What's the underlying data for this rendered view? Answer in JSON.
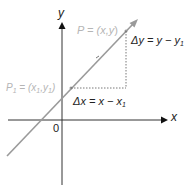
{
  "diagram": {
    "axes": {
      "x_label": "x",
      "y_label": "y",
      "origin_label": "0",
      "color": "#333333"
    },
    "line": {
      "color": "#9a9a9a"
    },
    "points": {
      "P": {
        "label_prefix": "P = (",
        "label_vars": "x,y",
        "label_suffix": ")",
        "color": "#b5b5b5"
      },
      "P1": {
        "label_name": "P",
        "label_sub": "1",
        "label_mid": " = (x",
        "label_sub_x": "1",
        "label_comma": ",y",
        "label_sub_y": "1",
        "label_end": ")",
        "color": "#b5b5b5"
      }
    },
    "delta_y": {
      "label_main": "Δy = y − y",
      "label_sub": "1"
    },
    "delta_x": {
      "label_main": "Δx = x − x",
      "label_sub": "1"
    },
    "guide_color": "#555555"
  }
}
